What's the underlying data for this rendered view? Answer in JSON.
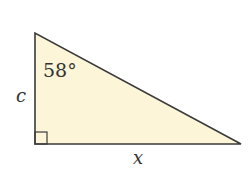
{
  "diagram": {
    "type": "right-triangle",
    "fill_color": "#fdf5d8",
    "stroke_color": "#3a3a3a",
    "vertices": {
      "top": [
        35,
        33
      ],
      "right_angle": [
        35,
        144
      ],
      "right": [
        241,
        144
      ]
    },
    "angle_label": "58°",
    "vertical_side_label": "c",
    "horizontal_side_label": "x",
    "right_angle_marker": true
  }
}
